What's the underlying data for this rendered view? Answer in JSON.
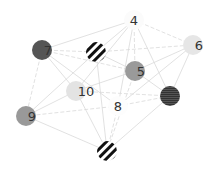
{
  "graph": {
    "type": "network",
    "nodes": [
      {
        "id": "4",
        "label": "4",
        "x": 134,
        "y": 20,
        "fill": "#fbfbfb",
        "pattern": "none",
        "label_dx": 0
      },
      {
        "id": "6",
        "label": "6",
        "x": 193,
        "y": 45,
        "fill": "#e6e6e6",
        "pattern": "none",
        "label_dx": 6
      },
      {
        "id": "7",
        "label": "7",
        "x": 42,
        "y": 50,
        "fill": "#555555",
        "pattern": "none",
        "label_dx": 6
      },
      {
        "id": "s1",
        "label": "",
        "x": 96,
        "y": 52,
        "fill": "#ffffff",
        "pattern": "diagonal",
        "label_dx": 0
      },
      {
        "id": "5",
        "label": "5",
        "x": 135,
        "y": 71,
        "fill": "#9a9a9a",
        "pattern": "none",
        "label_dx": 6
      },
      {
        "id": "10",
        "label": "10",
        "x": 76,
        "y": 91,
        "fill": "#e3e3e3",
        "pattern": "none",
        "label_dx": 10
      },
      {
        "id": "8",
        "label": "8",
        "x": 118,
        "y": 106,
        "fill": "#fdfdfd",
        "pattern": "none",
        "label_dx": 0
      },
      {
        "id": "h1",
        "label": "",
        "x": 170,
        "y": 96,
        "fill": "#444444",
        "pattern": "horizontal",
        "label_dx": 0
      },
      {
        "id": "9",
        "label": "9",
        "x": 26,
        "y": 116,
        "fill": "#999999",
        "pattern": "none",
        "label_dx": 6
      },
      {
        "id": "s2",
        "label": "",
        "x": 107,
        "y": 151,
        "fill": "#ffffff",
        "pattern": "diagonal",
        "label_dx": 0
      }
    ],
    "edges": [
      {
        "from": "4",
        "to": "7",
        "style": "solid"
      },
      {
        "from": "4",
        "to": "s1",
        "style": "solid"
      },
      {
        "from": "4",
        "to": "5",
        "style": "dashed"
      },
      {
        "from": "4",
        "to": "6",
        "style": "dashed"
      },
      {
        "from": "4",
        "to": "h1",
        "style": "solid"
      },
      {
        "from": "4",
        "to": "10",
        "style": "solid"
      },
      {
        "from": "4",
        "to": "8",
        "style": "solid"
      },
      {
        "from": "7",
        "to": "s1",
        "style": "dashed"
      },
      {
        "from": "7",
        "to": "5",
        "style": "dashed"
      },
      {
        "from": "7",
        "to": "10",
        "style": "solid"
      },
      {
        "from": "7",
        "to": "9",
        "style": "dashed"
      },
      {
        "from": "7",
        "to": "8",
        "style": "solid"
      },
      {
        "from": "s1",
        "to": "6",
        "style": "dashed"
      },
      {
        "from": "s1",
        "to": "5",
        "style": "solid"
      },
      {
        "from": "s1",
        "to": "9",
        "style": "solid"
      },
      {
        "from": "s1",
        "to": "s2",
        "style": "solid"
      },
      {
        "from": "5",
        "to": "10",
        "style": "solid"
      },
      {
        "from": "5",
        "to": "h1",
        "style": "solid"
      },
      {
        "from": "5",
        "to": "6",
        "style": "solid"
      },
      {
        "from": "5",
        "to": "s2",
        "style": "dashed"
      },
      {
        "from": "6",
        "to": "h1",
        "style": "solid"
      },
      {
        "from": "6",
        "to": "8",
        "style": "solid"
      },
      {
        "from": "10",
        "to": "h1",
        "style": "dashed"
      },
      {
        "from": "10",
        "to": "9",
        "style": "solid"
      },
      {
        "from": "10",
        "to": "s2",
        "style": "solid"
      },
      {
        "from": "8",
        "to": "9",
        "style": "dashed"
      },
      {
        "from": "8",
        "to": "h1",
        "style": "dashed"
      },
      {
        "from": "8",
        "to": "s2",
        "style": "dashed"
      },
      {
        "from": "9",
        "to": "s2",
        "style": "solid"
      },
      {
        "from": "h1",
        "to": "s2",
        "style": "solid"
      }
    ],
    "node_radius": 10,
    "edge_color": "#d9d9d9",
    "label_color": "#333333",
    "stripe_color": "#111111"
  }
}
